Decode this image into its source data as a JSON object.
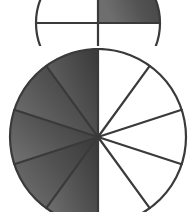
{
  "figure": {
    "background_color": "#ffffff",
    "stroke_color": "#3a3a3a",
    "shaded_color": "#4f4f4f",
    "shaded_color_light": "#6a6a6a",
    "unshaded_color": "#ffffff",
    "stroke_width": "2.2"
  },
  "chart_data": [
    {
      "type": "pie",
      "id": "top-circle",
      "title": "Top fraction circle (partially cropped by image edge)",
      "slice_count": 4,
      "slice_angle_degrees": 90,
      "start_angle_degrees": 0,
      "categories": [
        "slice-1",
        "slice-2",
        "slice-3",
        "slice-4"
      ],
      "values": [
        25,
        25,
        25,
        25
      ],
      "shaded": [
        true,
        false,
        false,
        false
      ],
      "shaded_count": 1,
      "fraction_label": "1/4",
      "center": {
        "cx": 98,
        "cy": -17
      },
      "radius": 62,
      "cropped": true,
      "crop_note": "Only the lower portion of this circle is visible at the top of the image.",
      "legend": [],
      "grid": false
    },
    {
      "type": "pie",
      "id": "bottom-circle",
      "title": "Bottom fraction circle",
      "slice_count": 10,
      "slice_angle_degrees": 36,
      "start_angle_degrees": 0,
      "categories": [
        "slice-1",
        "slice-2",
        "slice-3",
        "slice-4",
        "slice-5",
        "slice-6",
        "slice-7",
        "slice-8",
        "slice-9",
        "slice-10"
      ],
      "values": [
        10,
        10,
        10,
        10,
        10,
        10,
        10,
        10,
        10,
        10
      ],
      "shaded": [
        false,
        false,
        false,
        false,
        false,
        true,
        true,
        true,
        true,
        true
      ],
      "shaded_count": 5,
      "fraction_label": "5/10",
      "center": {
        "cx": 98,
        "cy": 89
      },
      "radius": 88,
      "cropped": true,
      "crop_note": "The very bottom of this circle touches the image edge.",
      "legend": [],
      "grid": false
    }
  ]
}
